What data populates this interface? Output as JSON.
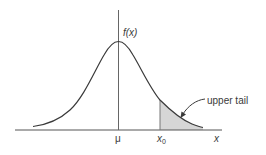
{
  "diagram": {
    "type": "normal-distribution-upper-tail",
    "labels": {
      "function": "f(x)",
      "mean": "μ",
      "threshold": "x",
      "threshold_sub": "0",
      "axis": "x",
      "tail_callout": "upper tail"
    },
    "colors": {
      "curve": "#3a3a3a",
      "axis": "#555555",
      "shade": "#d6d6d6",
      "text": "#3a3a3a"
    }
  }
}
